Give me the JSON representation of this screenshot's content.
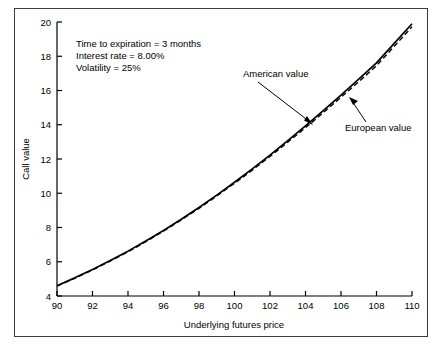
{
  "chart_data": {
    "type": "line",
    "title": "",
    "xlabel": "Underlying futures price",
    "ylabel": "Call value",
    "xlim": [
      90,
      110
    ],
    "ylim": [
      4,
      20
    ],
    "xticks": [
      90,
      92,
      94,
      96,
      98,
      100,
      102,
      104,
      106,
      108,
      110
    ],
    "yticks": [
      4,
      6,
      8,
      10,
      12,
      14,
      16,
      18,
      20
    ],
    "grid": false,
    "legend_position": "inline-annotations",
    "series": [
      {
        "name": "American value",
        "style": "solid",
        "color": "#000000",
        "x": [
          90,
          91,
          92,
          93,
          94,
          95,
          96,
          97,
          98,
          99,
          100,
          101,
          102,
          103,
          104,
          105,
          106,
          107,
          108,
          109,
          110
        ],
        "values": [
          4.6,
          5.06,
          5.55,
          6.07,
          6.62,
          7.21,
          7.83,
          8.48,
          9.17,
          9.89,
          10.64,
          11.42,
          12.23,
          13.07,
          13.93,
          14.82,
          15.73,
          16.66,
          17.61,
          18.75,
          19.9
        ]
      },
      {
        "name": "European value",
        "style": "dashed",
        "color": "#000000",
        "x": [
          90,
          91,
          92,
          93,
          94,
          95,
          96,
          97,
          98,
          99,
          100,
          101,
          102,
          103,
          104,
          105,
          106,
          107,
          108,
          109,
          110
        ],
        "values": [
          4.58,
          5.03,
          5.52,
          6.04,
          6.58,
          7.17,
          7.79,
          8.44,
          9.12,
          9.84,
          10.58,
          11.35,
          12.15,
          12.98,
          13.83,
          14.7,
          15.6,
          16.51,
          17.45,
          18.58,
          19.72
        ]
      }
    ],
    "annotations": [
      {
        "name": "parameters-note",
        "lines": [
          "Time to expiration = 3 months",
          "Interest rate = 8.00%",
          "Volatility = 25%"
        ]
      },
      {
        "name": "american-value-callout",
        "text": "American value"
      },
      {
        "name": "european-value-callout",
        "text": "European value"
      }
    ]
  },
  "axes": {
    "x_title": "Underlying futures price",
    "y_title": "Call value",
    "x_tick_labels": [
      "90",
      "92",
      "94",
      "96",
      "98",
      "100",
      "102",
      "104",
      "106",
      "108",
      "110"
    ],
    "y_tick_labels": [
      "4",
      "6",
      "8",
      "10",
      "12",
      "14",
      "16",
      "18",
      "20"
    ]
  },
  "notes": {
    "line1": "Time to expiration = 3 months",
    "line2": "Interest rate = 8.00%",
    "line3": "Volatility = 25%"
  },
  "labels": {
    "american": "American value",
    "european": "European value"
  },
  "colors": {
    "frame": "#3b3b3b",
    "axis": "#000000",
    "curve": "#000000",
    "background": "#ffffff"
  }
}
